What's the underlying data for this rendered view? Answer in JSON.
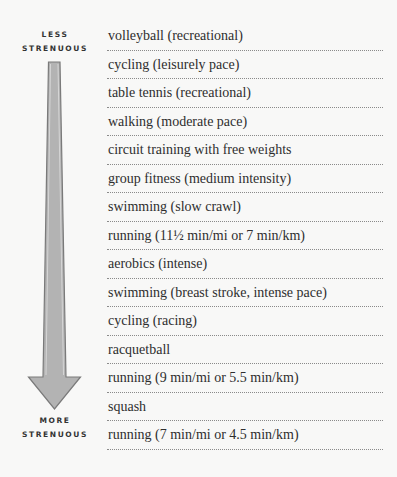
{
  "labels": {
    "top_line1": "LESS",
    "top_line2": "STRENUOUS",
    "bottom_line1": "MORE",
    "bottom_line2": "STRENUOUS"
  },
  "arrow": {
    "icon": "down-arrow-icon",
    "fill": "#b3b3b3",
    "outline": "#7a7a7a",
    "direction": "down"
  },
  "activities": [
    "volleyball (recreational)",
    "cycling (leisurely pace)",
    "table tennis (recreational)",
    "walking (moderate pace)",
    "circuit training with free weights",
    "group fitness (medium intensity)",
    "swimming (slow crawl)",
    "running (11½ min/mi or 7 min/km)",
    "aerobics (intense)",
    "swimming (breast stroke, intense pace)",
    "cycling (racing)",
    "racquetball",
    "running (9 min/mi or 5.5 min/km)",
    "squash",
    "running (7 min/mi or 4.5 min/km)"
  ]
}
